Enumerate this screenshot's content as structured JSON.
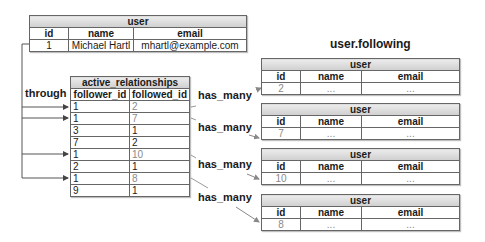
{
  "source_table": {
    "title": "user",
    "columns": [
      "id",
      "name",
      "email"
    ],
    "row": [
      "1",
      "Michael Hartl",
      "mhartl@example.com"
    ]
  },
  "through_label": "through",
  "join_table": {
    "title": "active_relationships",
    "columns": [
      "follower_id",
      "followed_id"
    ],
    "rows": [
      {
        "follower_id": "1",
        "followed_id": "2",
        "highlighted": true
      },
      {
        "follower_id": "1",
        "followed_id": "7",
        "highlighted": true
      },
      {
        "follower_id": "3",
        "followed_id": "1",
        "highlighted": false
      },
      {
        "follower_id": "7",
        "followed_id": "2",
        "highlighted": false
      },
      {
        "follower_id": "1",
        "followed_id": "10",
        "highlighted": true
      },
      {
        "follower_id": "2",
        "followed_id": "1",
        "highlighted": false
      },
      {
        "follower_id": "1",
        "followed_id": "8",
        "highlighted": true
      },
      {
        "follower_id": "9",
        "followed_id": "1",
        "highlighted": false
      }
    ]
  },
  "result_title": "user.following",
  "relation_label": "has_many",
  "target_tables": [
    {
      "title": "user",
      "columns": [
        "id",
        "name",
        "email"
      ],
      "row": [
        "2",
        "...",
        "..."
      ]
    },
    {
      "title": "user",
      "columns": [
        "id",
        "name",
        "email"
      ],
      "row": [
        "7",
        "...",
        "..."
      ]
    },
    {
      "title": "user",
      "columns": [
        "id",
        "name",
        "email"
      ],
      "row": [
        "10",
        "...",
        "..."
      ]
    },
    {
      "title": "user",
      "columns": [
        "id",
        "name",
        "email"
      ],
      "row": [
        "8",
        "...",
        "..."
      ]
    }
  ]
}
